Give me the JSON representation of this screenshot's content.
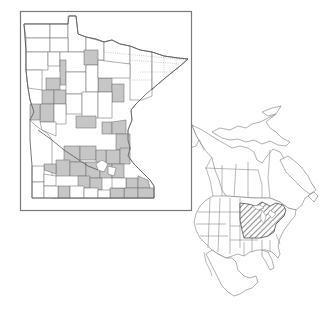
{
  "figure": {
    "title": "",
    "legend": []
  },
  "minnesota_map": {
    "label": "Minnesota county distribution",
    "fill_color": "#c6c6c6",
    "empty_color": "#ffffff",
    "line_color": "#6e6e6e",
    "symbology": "shaded counties = documented occurrence"
  },
  "north_america_map": {
    "label": "North American range",
    "range_pattern": "diagonal hatching",
    "range_region": "Upper Midwest and northeastern United States / southeastern Canada",
    "line_color": "#8a8a8a"
  }
}
